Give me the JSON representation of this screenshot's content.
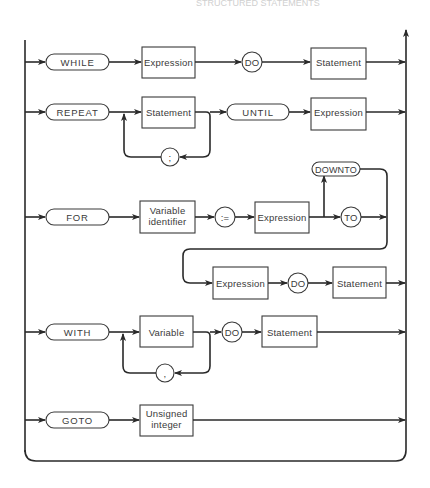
{
  "header": {
    "text": "STRUCTURED STATEMENTS"
  },
  "diagram": {
    "type": "syntax-diagram",
    "rows": {
      "while": {
        "keyword": "WHILE",
        "condition": "Expression",
        "do": "DO",
        "body": "Statement"
      },
      "repeat": {
        "keyword": "REPEAT",
        "body": "Statement",
        "separator": ";",
        "until": "UNTIL",
        "condition": "Expression"
      },
      "for": {
        "keyword": "FOR",
        "control_line1": "Variable",
        "control_line2": "identifier",
        "assign": ":=",
        "initial": "Expression",
        "downto": "DOWNTO",
        "to": "TO",
        "final": "Expression",
        "do": "DO",
        "body": "Statement"
      },
      "with": {
        "keyword": "WITH",
        "record": "Variable",
        "separator": ",",
        "do": "DO",
        "body": "Statement"
      },
      "goto": {
        "keyword": "GOTO",
        "label_line1": "Unsigned",
        "label_line2": "integer"
      }
    }
  }
}
